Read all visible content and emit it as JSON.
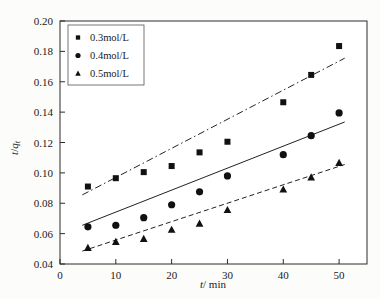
{
  "chart_data": {
    "type": "scatter",
    "title": "",
    "xlabel": "t/ min",
    "ylabel": "t/qt",
    "xlim": [
      0,
      55
    ],
    "ylim": [
      0.04,
      0.2
    ],
    "xticks": [
      0,
      10,
      20,
      30,
      40,
      50
    ],
    "xtick_labels": [
      "0",
      "10",
      "20",
      "30",
      "40",
      "50"
    ],
    "yticks": [
      0.04,
      0.06,
      0.08,
      0.1,
      0.12,
      0.14,
      0.16,
      0.18,
      0.2
    ],
    "ytick_labels": [
      "0.04",
      "0.06",
      "0.08",
      "0.10",
      "0.12",
      "0.14",
      "0.16",
      "0.18",
      "0.20"
    ],
    "grid": false,
    "legend_position": "upper-left",
    "series": [
      {
        "name": "0.3mol/L",
        "marker": "square",
        "line_style": "dash-dot",
        "x": [
          5,
          10,
          15,
          20,
          25,
          30,
          40,
          45,
          50
        ],
        "values": [
          0.091,
          0.0965,
          0.1005,
          0.1045,
          0.1135,
          0.1205,
          0.1465,
          0.1645,
          0.1835
        ],
        "fit_start": [
          4,
          0.0855
        ],
        "fit_end": [
          51,
          0.1755
        ]
      },
      {
        "name": "0.4mol/L",
        "marker": "circle",
        "line_style": "solid",
        "x": [
          5,
          10,
          15,
          20,
          25,
          30,
          40,
          45,
          50
        ],
        "values": [
          0.0645,
          0.0655,
          0.0705,
          0.079,
          0.0875,
          0.098,
          0.112,
          0.1245,
          0.1395
        ],
        "fit_start": [
          4,
          0.0655
        ],
        "fit_end": [
          51,
          0.1335
        ]
      },
      {
        "name": "0.5mol/L",
        "marker": "triangle",
        "line_style": "dashed",
        "x": [
          5,
          10,
          15,
          20,
          25,
          30,
          40,
          45,
          50
        ],
        "values": [
          0.0505,
          0.0545,
          0.0565,
          0.0625,
          0.0665,
          0.0755,
          0.089,
          0.097,
          0.1065
        ],
        "fit_start": [
          4,
          0.0485
        ],
        "fit_end": [
          51,
          0.1055
        ]
      }
    ]
  },
  "legend": {
    "entries": [
      {
        "label": "0.3mol/L",
        "marker": "square"
      },
      {
        "label": "0.4mol/L",
        "marker": "circle"
      },
      {
        "label": "0.5mol/L",
        "marker": "triangle"
      }
    ]
  },
  "axes": {
    "x_title_var": "t",
    "x_title_rest": "/ min",
    "y_title_var": "t",
    "y_title_sep": "/",
    "y_title_q": "q",
    "y_title_sub": "t"
  }
}
